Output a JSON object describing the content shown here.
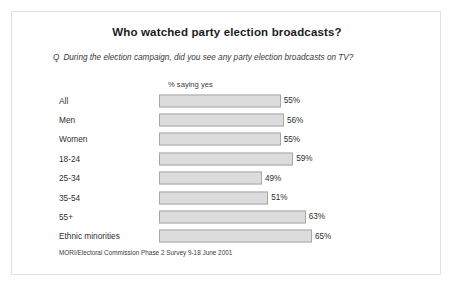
{
  "chart_data": {
    "type": "bar",
    "orientation": "horizontal",
    "title": "Who watched party election broadcasts?",
    "question_prefix": "Q",
    "question": "During the election campaign, did you see any party election broadcasts on TV?",
    "xlabel": "% saying yes",
    "ylabel": "",
    "categories": [
      "All",
      "Men",
      "Women",
      "18-24",
      "25-34",
      "35-54",
      "55+",
      "Ethnic minorities"
    ],
    "values": [
      55,
      56,
      55,
      59,
      49,
      51,
      63,
      65
    ],
    "value_labels": [
      "55%",
      "56%",
      "55%",
      "59%",
      "49%",
      "51%",
      "63%",
      "65%"
    ],
    "xlim": [
      0,
      70
    ],
    "grid": false,
    "legend": null,
    "source": "MORI/Electoral Commission Phase 2 Survey 9-18 June 2001",
    "colors": {
      "bar_fill": "#dcdcdc",
      "bar_border": "#a8a8a8",
      "background": "#ffffff",
      "frame": "#e2e2e2",
      "text": "#2b2b2b"
    }
  }
}
